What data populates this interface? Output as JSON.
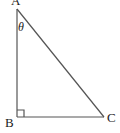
{
  "diagram": {
    "type": "right-triangle",
    "stroke_color": "#555555",
    "label_color": "#222222",
    "vertices": [
      {
        "id": "A",
        "label": "A"
      },
      {
        "id": "B",
        "label": "B"
      },
      {
        "id": "C",
        "label": "C"
      }
    ],
    "angle_label": "θ",
    "right_angle_at": "B"
  }
}
